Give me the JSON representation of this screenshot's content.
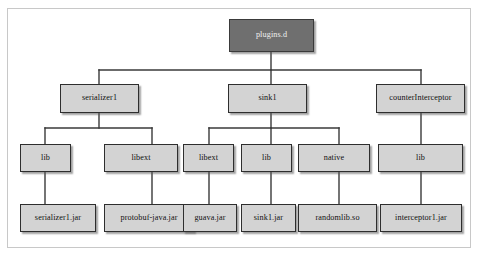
{
  "figure": {
    "background_color": "#ffffff",
    "frame_color": "#c8c8c8",
    "node_fill": "#d3d3d3",
    "root_fill": "#6f6f6f",
    "border_color": "#2e2e2e",
    "edge_color": "#3a3a3a"
  },
  "tree": {
    "root": {
      "label": "plugins.d",
      "level": 1
    },
    "level2": [
      {
        "label": "serializer1"
      },
      {
        "label": "sink1"
      },
      {
        "label": "counterInterceptor"
      }
    ],
    "level3": [
      {
        "label": "lib",
        "parent": "serializer1"
      },
      {
        "label": "libext",
        "parent": "serializer1"
      },
      {
        "label": "libext",
        "parent": "sink1"
      },
      {
        "label": "lib",
        "parent": "sink1"
      },
      {
        "label": "native",
        "parent": "sink1"
      },
      {
        "label": "lib",
        "parent": "counterInterceptor"
      }
    ],
    "level4": [
      {
        "label": "serializer1.jar",
        "parent": "serializer1/lib"
      },
      {
        "label": "protobuf-java.jar",
        "parent": "serializer1/libext"
      },
      {
        "label": "guava.jar",
        "parent": "sink1/libext"
      },
      {
        "label": "sink1.jar",
        "parent": "sink1/lib"
      },
      {
        "label": "randomlib.so",
        "parent": "sink1/native"
      },
      {
        "label": "interceptor1.jar",
        "parent": "counterInterceptor/lib"
      }
    ]
  }
}
